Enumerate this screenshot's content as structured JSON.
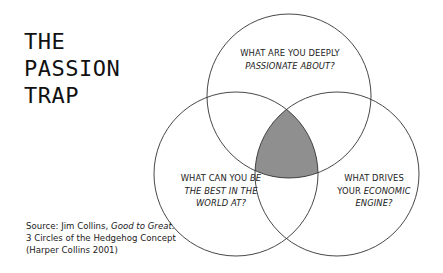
{
  "title": {
    "lines": [
      "THE",
      "PASSION",
      "TRAP"
    ]
  },
  "source": {
    "prefix": "Source: Jim Collins, ",
    "book": "Good to Great",
    "suffix": ". 3 Circles of the Hedgehog Concept (Harper Collins 2001)"
  },
  "circles": {
    "top": {
      "line1": "WHAT ARE YOU DEEPLY",
      "line2_italic": "PASSIONATE ABOUT?"
    },
    "left": {
      "line1_plain": "WHAT CAN YOU ",
      "line1_italic": "BE",
      "line2_italic": "THE BEST IN THE",
      "line3_italic": "WORLD AT?"
    },
    "right": {
      "line1": "WHAT DRIVES",
      "line2_plain": "YOUR ",
      "line2_italic": "ECONOMIC",
      "line3_italic": "ENGINE?"
    }
  },
  "colors": {
    "stroke": "#333333",
    "intersection": "#8f8f8f"
  }
}
